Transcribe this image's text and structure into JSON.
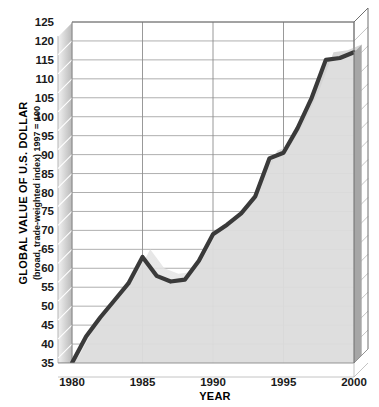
{
  "chart_data": {
    "type": "area",
    "title": "",
    "subtitle": "",
    "xlabel": "YEAR",
    "ylabel": "GLOBAL VALUE OF U.S. DOLLAR",
    "ylabel_sub": "(broad, trade-weighted index) 1997 = 100",
    "xlim": [
      1980,
      2000
    ],
    "ylim": [
      35,
      125
    ],
    "ytick_step": 5,
    "grid": true,
    "legend": "none",
    "style_3d": true,
    "x": [
      1980,
      1981,
      1982,
      1983,
      1984,
      1985,
      1986,
      1987,
      1988,
      1989,
      1990,
      1991,
      1992,
      1993,
      1994,
      1995,
      1996,
      1997,
      1998,
      1999,
      2000
    ],
    "values": [
      35,
      42,
      47,
      51.5,
      56,
      63,
      58,
      56.5,
      57,
      62,
      69,
      71.5,
      74.5,
      79,
      89,
      90.5,
      97,
      105,
      115,
      115.5,
      117
    ],
    "xticks": [
      "1980",
      "1985",
      "1990",
      "1995",
      "2000"
    ],
    "xtick_values": [
      1980,
      1985,
      1990,
      1995,
      2000
    ],
    "yticks": [
      "35",
      "40",
      "45",
      "50",
      "55",
      "60",
      "65",
      "70",
      "75",
      "80",
      "85",
      "90",
      "95",
      "100",
      "105",
      "110",
      "115",
      "120",
      "125"
    ],
    "ytick_values": [
      35,
      40,
      45,
      50,
      55,
      60,
      65,
      70,
      75,
      80,
      85,
      90,
      95,
      100,
      105,
      110,
      115,
      120,
      125
    ],
    "colors": {
      "line": "#3a3a3a",
      "area_fill": "#d8d8d8",
      "wall": "#9e9e9e",
      "gridline": "#9a9a9a",
      "background": "#ffffff",
      "text": "#111111"
    }
  },
  "axis": {
    "y_title": "GLOBAL VALUE OF U.S. DOLLAR",
    "y_subtitle": "(broad, trade-weighted index) 1997 = 100",
    "x_title": "YEAR"
  }
}
